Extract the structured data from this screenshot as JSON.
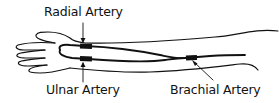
{
  "diagram": {
    "labels": {
      "radial": "Radial Artery",
      "ulnar": "Ulnar Artery",
      "brachial": "Brachial Artery"
    },
    "colors": {
      "ink": "#111111",
      "background": "#ffffff"
    }
  }
}
